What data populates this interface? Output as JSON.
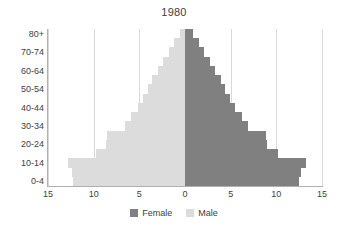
{
  "chart_data": {
    "type": "bar",
    "subtype": "population-pyramid",
    "title": "1980",
    "xlabel": "",
    "ylabel": "",
    "grid": true,
    "legend_position": "bottom",
    "orientation": "horizontal",
    "axis_max": 15,
    "x_tick_labels": [
      "15",
      "10",
      "5",
      "0",
      "5",
      "10",
      "15"
    ],
    "x_tick_values": [
      -15,
      -10,
      -5,
      0,
      5,
      10,
      15
    ],
    "categories": [
      "0-4",
      "5-9",
      "10-14",
      "15-19",
      "20-24",
      "25-29",
      "30-34",
      "35-39",
      "40-44",
      "45-49",
      "50-54",
      "55-59",
      "60-64",
      "65-69",
      "70-74",
      "75-79",
      "80+"
    ],
    "y_tick_labels": [
      "0-4",
      "10-14",
      "20-24",
      "30-34",
      "40-44",
      "50-54",
      "60-64",
      "70-74",
      "80+"
    ],
    "y_tick_categories": [
      "0-4",
      "10-14",
      "20-24",
      "30-34",
      "40-44",
      "50-54",
      "60-64",
      "70-74",
      "80+"
    ],
    "series": [
      {
        "name": "Female",
        "side": "right",
        "color": "#808080",
        "values": [
          12.5,
          12.7,
          13.2,
          10.2,
          9.0,
          8.9,
          6.9,
          6.2,
          5.5,
          4.9,
          4.4,
          3.9,
          3.3,
          2.7,
          2.1,
          1.5,
          0.9
        ]
      },
      {
        "name": "Male",
        "side": "left",
        "color": "#dcdcdc",
        "values": [
          12.3,
          12.4,
          12.8,
          9.7,
          8.6,
          8.5,
          6.6,
          5.9,
          5.2,
          4.6,
          4.1,
          3.6,
          3.0,
          2.4,
          1.8,
          1.2,
          0.6
        ]
      }
    ]
  },
  "legend": {
    "items": [
      {
        "label": "Female",
        "color": "#808080"
      },
      {
        "label": "Male",
        "color": "#dcdcdc"
      }
    ]
  },
  "colors": {
    "female": "#808080",
    "male": "#dcdcdc",
    "gridline": "#d9d9d9",
    "axis": "#b0b0b0",
    "text": "#404040",
    "background": "#ffffff"
  }
}
